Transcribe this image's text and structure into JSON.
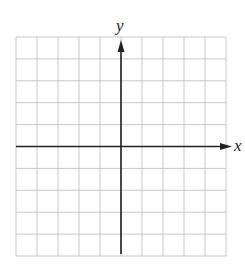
{
  "chart_data": {
    "type": "scatter",
    "title": "",
    "xlabel": "x",
    "ylabel": "y",
    "xlim": [
      -5,
      5
    ],
    "ylim": [
      -5,
      5
    ],
    "grid": true,
    "grid_cells": {
      "columns": 10,
      "rows": 10
    },
    "tick_labels": {
      "x": [],
      "y": []
    },
    "series": [],
    "legend": null,
    "layout": {
      "grid_left": 16,
      "grid_top": 37,
      "grid_right": 226,
      "grid_bottom": 256,
      "origin_x": 121,
      "origin_y": 146,
      "x_arrow_tip": 232,
      "y_arrow_tip": 40
    },
    "colors": {
      "grid": "#c8c8c8",
      "axis": "#222222",
      "background": "#ffffff"
    }
  },
  "labels": {
    "x_axis": "x",
    "y_axis": "y"
  }
}
